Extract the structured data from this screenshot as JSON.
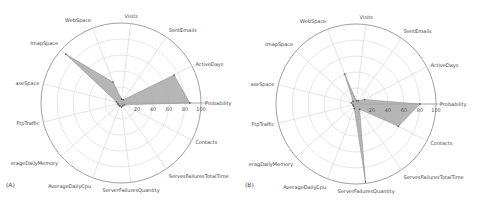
{
  "chart_data": [
    {
      "type": "radar",
      "panel_label": "(A)",
      "axes": [
        "Probability",
        "ActiveDays",
        "SentEmails",
        "Visits",
        "WebSpace",
        "ImapSpace",
        "DatabaseSpace",
        "FtpTraffic",
        "AverageDailyMemory",
        "AverageDailyCpu",
        "ServerFailuresQuantity",
        "ServesFailuresTotalTime",
        "Contacts"
      ],
      "axis_labels_visible": [
        "Probability",
        "ActiveDays",
        "SentEmails",
        "Visits",
        "WebSpace",
        "ImapSpace",
        "aseSpace",
        "FtpTraffic",
        "erageDailyMemory",
        "AverageDailyCpu",
        "ServerFailuresQuantity",
        "ServesFailuresTotalTime",
        "Contacts"
      ],
      "values": [
        86,
        75,
        5,
        5,
        28,
        92,
        6,
        4,
        4,
        4,
        5,
        4,
        5
      ],
      "radial_ticks": [
        20,
        40,
        60,
        80,
        100
      ],
      "rlim": [
        0,
        100
      ],
      "fill_color": "#a9a9a9",
      "grid": true
    },
    {
      "type": "radar",
      "panel_label": "(B)",
      "axes": [
        "Probability",
        "ActiveDays",
        "SentEmails",
        "Visits",
        "WebSpace",
        "ImapSpace",
        "DatabaseSpace",
        "FtpTraffic",
        "AverageDailyMemory",
        "AverageDailyCpu",
        "ServerFailuresQuantity",
        "ServesFailuresTotalTime",
        "Contacts"
      ],
      "axis_labels_visible": [
        "Probability",
        "ActiveDays",
        "SentEmails",
        "Visits",
        "WebSpace",
        "ImapSpace",
        "aseSpace",
        "FtpTraffic",
        "eragDailyMemory",
        "AverageDailyCpu",
        "ServerFailuresQuantity",
        "ServesFailuresTotalTime",
        "Contacts"
      ],
      "values": [
        80,
        12,
        5,
        4,
        40,
        5,
        6,
        4,
        4,
        6,
        98,
        8,
        60
      ],
      "radial_ticks": [
        20,
        40,
        60,
        80,
        100
      ],
      "rlim": [
        0,
        100
      ],
      "fill_color": "#a9a9a9",
      "grid": true
    }
  ]
}
